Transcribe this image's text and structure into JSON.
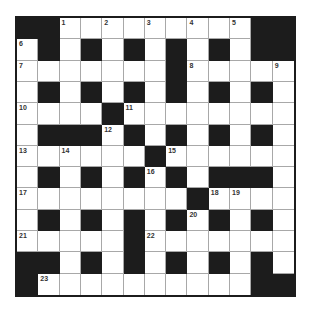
{
  "puzzle": {
    "rows": 13,
    "cols": 13,
    "grid": [
      "##.........#",
      ".#.#.#.#.#.##",
      ".......#.....",
      ".#.#.#.#.#.#.",
      "....#........",
      ".###.#.#.#.#.",
      "......#......",
      ".#.#.#.#.###.",
      "........#....",
      ".#.#.#.#.#.#.",
      ".....#.......",
      "##.#.#.#.#.#.",
      "#..........##"
    ],
    "numbers": [
      {
        "row": 0,
        "col": 2,
        "n": "1"
      },
      {
        "row": 0,
        "col": 4,
        "n": "2"
      },
      {
        "row": 0,
        "col": 6,
        "n": "3"
      },
      {
        "row": 0,
        "col": 8,
        "n": "4"
      },
      {
        "row": 0,
        "col": 10,
        "n": "5"
      },
      {
        "row": 1,
        "col": 0,
        "n": "6"
      },
      {
        "row": 2,
        "col": 0,
        "n": "7"
      },
      {
        "row": 2,
        "col": 8,
        "n": "8"
      },
      {
        "row": 2,
        "col": 12,
        "n": "9"
      },
      {
        "row": 4,
        "col": 0,
        "n": "10"
      },
      {
        "row": 4,
        "col": 5,
        "n": "11"
      },
      {
        "row": 5,
        "col": 4,
        "n": "12"
      },
      {
        "row": 6,
        "col": 0,
        "n": "13"
      },
      {
        "row": 6,
        "col": 2,
        "n": "14"
      },
      {
        "row": 6,
        "col": 7,
        "n": "15"
      },
      {
        "row": 7,
        "col": 6,
        "n": "16"
      },
      {
        "row": 8,
        "col": 0,
        "n": "17"
      },
      {
        "row": 8,
        "col": 9,
        "n": "18"
      },
      {
        "row": 8,
        "col": 10,
        "n": "19"
      },
      {
        "row": 9,
        "col": 8,
        "n": "20"
      },
      {
        "row": 10,
        "col": 0,
        "n": "21"
      },
      {
        "row": 10,
        "col": 6,
        "n": "22"
      },
      {
        "row": 12,
        "col": 1,
        "n": "23"
      }
    ]
  }
}
